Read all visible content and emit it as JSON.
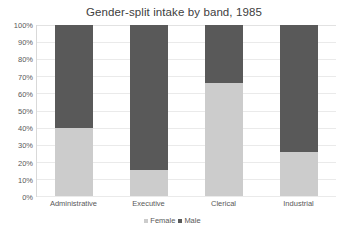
{
  "chart_data": {
    "type": "bar",
    "subtype": "stacked-percent",
    "title": "Gender-split intake by band, 1985",
    "xlabel": "",
    "ylabel": "",
    "categories": [
      "Administrative",
      "Executive",
      "Clerical",
      "Industrial"
    ],
    "series": [
      {
        "name": "Female",
        "color": "#cccccc",
        "values": [
          40,
          15,
          66,
          26
        ]
      },
      {
        "name": "Male",
        "color": "#595959",
        "values": [
          60,
          85,
          34,
          74
        ]
      }
    ],
    "ylim": [
      0,
      100
    ],
    "y_ticks": [
      0,
      10,
      20,
      30,
      40,
      50,
      60,
      70,
      80,
      90,
      100
    ],
    "y_tick_labels": [
      "0%",
      "10%",
      "20%",
      "30%",
      "40%",
      "50%",
      "60%",
      "70%",
      "80%",
      "90%",
      "100%"
    ],
    "grid": true,
    "grid_axis": "y",
    "legend_position": "bottom",
    "value_unit": "%"
  },
  "colors": {
    "female": "#cccccc",
    "male": "#595959",
    "gridline": "#eaeaea",
    "axis": "#d9d9d9",
    "text": "#595959",
    "title_text": "#404040",
    "background": "#ffffff"
  }
}
